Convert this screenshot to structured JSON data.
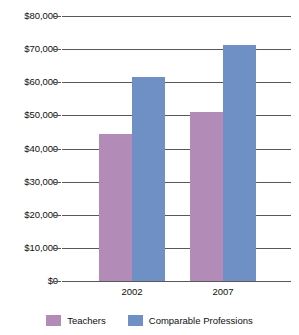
{
  "chart_data": {
    "type": "bar",
    "title": "",
    "subtitle": "",
    "xlabel": "",
    "ylabel": "",
    "categories": [
      "2002",
      "2007"
    ],
    "series": [
      {
        "name": "Teachers",
        "color": "#b28cb6",
        "values": [
          44500,
          51000
        ]
      },
      {
        "name": "Comparable Professions",
        "color": "#6f90c5",
        "values": [
          61700,
          71300
        ]
      }
    ],
    "ylim": [
      0,
      80000
    ],
    "ytick_step": 10000,
    "ytick_labels": [
      "$80,000",
      "$70,000",
      "$60,000",
      "$50,000",
      "$40,000",
      "$30,000",
      "$20,000",
      "$10,000",
      "$0"
    ],
    "ytick_values": [
      80000,
      70000,
      60000,
      50000,
      40000,
      30000,
      20000,
      10000,
      0
    ],
    "grid": true,
    "legend_position": "bottom",
    "gridline_color": "#58585a",
    "background_color": "#ffffff"
  },
  "legend": {
    "entries": [
      {
        "label": "Teachers",
        "swatch": "teachers-swatch"
      },
      {
        "label": "Comparable Professions",
        "swatch": "comparable-professions-swatch"
      }
    ]
  }
}
